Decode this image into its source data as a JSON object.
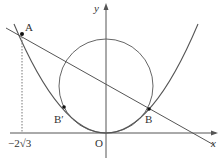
{
  "diagram": {
    "axes": {
      "x_label": "x",
      "y_label": "y",
      "origin_label": "O"
    },
    "points": {
      "A": "A",
      "B": "B",
      "B_prime": "B′"
    },
    "tick_label": "−2√3",
    "colors": {
      "stroke": "#555555",
      "text": "#333333"
    }
  }
}
